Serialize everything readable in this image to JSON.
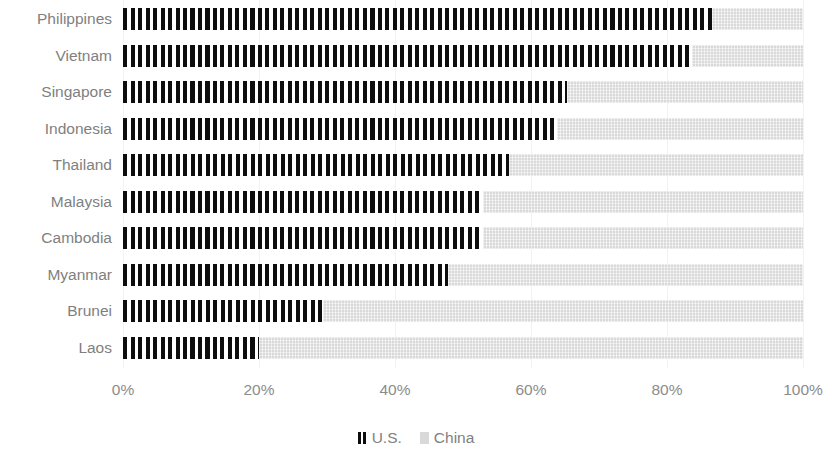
{
  "chart_data": {
    "type": "bar",
    "orientation": "horizontal",
    "stacked": true,
    "normalized_percent": true,
    "title": "",
    "subtitle": "",
    "xlabel": "",
    "ylabel": "",
    "xlim": [
      0,
      100
    ],
    "xticks": [
      "0%",
      "20%",
      "40%",
      "60%",
      "80%",
      "100%"
    ],
    "xtick_values": [
      0,
      20,
      40,
      60,
      80,
      100
    ],
    "grid": "vertical",
    "legend_position": "bottom",
    "categories": [
      "Philippines",
      "Vietnam",
      "Singapore",
      "Indonesia",
      "Thailand",
      "Malaysia",
      "Cambodia",
      "Myanmar",
      "Brunei",
      "Laos"
    ],
    "series": [
      {
        "name": "U.S.",
        "color": "#0d0d0d",
        "pattern": "vertical-hatch",
        "values": [
          86.6,
          83.7,
          65.3,
          63.8,
          56.8,
          52.9,
          52.9,
          47.8,
          29.4,
          20.0
        ]
      },
      {
        "name": "China",
        "color": "#d9d9d9",
        "pattern": "light-dotted",
        "values": [
          13.4,
          16.3,
          34.7,
          36.2,
          43.2,
          47.1,
          47.1,
          52.2,
          70.6,
          80.0
        ]
      }
    ]
  },
  "legend": {
    "entries": [
      {
        "label": "U.S.",
        "swatch": "us-hatch-swatch"
      },
      {
        "label": "China",
        "swatch": "china-gray-swatch"
      }
    ]
  }
}
